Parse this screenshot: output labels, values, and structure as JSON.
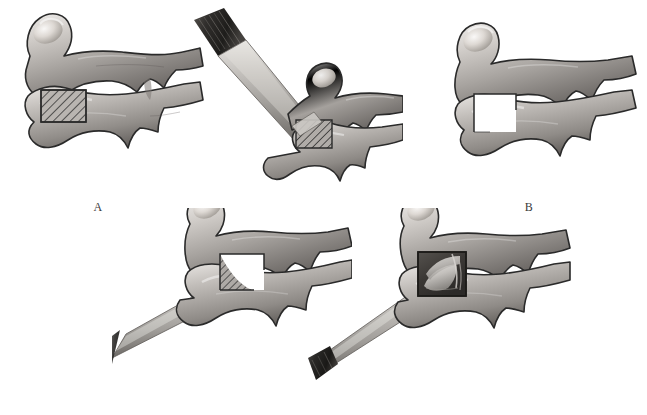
{
  "figure": {
    "background_color": "#ffffff",
    "panel_count": 5,
    "modality": "grayscale medical line-and-wash illustration",
    "view": "lateral view of two adjacent cervical vertebrae"
  },
  "palette": {
    "background": "#ffffff",
    "outline": "#2a2a2a",
    "bone_light": "#f2f0ee",
    "bone_midlight": "#cfcbc7",
    "bone_mid": "#a8a4a0",
    "bone_dark": "#6e6a67",
    "bone_shadow": "#4a4643",
    "hatch_line": "#2e2e2e",
    "hatch_fill": "#b9b5b1",
    "instrument_shaft_light": "#d8d6d3",
    "instrument_shaft_mid": "#a9a6a2",
    "instrument_shaft_dark": "#6f6c68",
    "instrument_handle_dark": "#2c2b29",
    "instrument_handle_mid": "#565451",
    "graft_dark": "#3a3835",
    "graft_light": "#d5d2ce",
    "label_text": "#3b3b3b"
  },
  "panels": [
    {
      "id": "panel-a",
      "label": "A",
      "caption_text": "A",
      "description": "Two adjacent cervical vertebrae in lateral view; a hatched rectangular zone marks the planned resection at the anterior superior endplate region of the lower vertebra.",
      "has_instrument": false,
      "has_hatched_region": true,
      "has_excised_notch": false,
      "has_graft_block": false,
      "vertebra_count": 2
    },
    {
      "id": "panel-b",
      "label": "B",
      "caption_text": "B",
      "description": "An osteotome/chisel enters from the upper left at an oblique downward angle, its cutting edge set against the hatched resection zone.",
      "has_instrument": true,
      "instrument_name": "osteotome",
      "instrument_approach": "upper-left oblique, descending to the right",
      "has_hatched_region": true,
      "has_excised_notch": false,
      "has_graft_block": false,
      "vertebra_count": 2
    },
    {
      "id": "panel-c",
      "label": "C",
      "caption_text": "C",
      "description": "The resection is complete; the removed wedge appears as an empty white stepped notch outlined in thin dark line between the two vertebral bodies.",
      "has_instrument": false,
      "has_hatched_region": false,
      "has_excised_notch": true,
      "has_graft_block": false,
      "vertebra_count": 2
    },
    {
      "id": "panel-d",
      "label": "D",
      "caption_text": "D",
      "description": "A second osteotome approaches from the lower left, angled upward to the right; a hatched zone marks the complementary resection on the opposing endplate.",
      "has_instrument": true,
      "instrument_name": "osteotome",
      "instrument_approach": "lower-left oblique, ascending to the right",
      "has_hatched_region": true,
      "has_excised_notch": true,
      "has_graft_block": false,
      "vertebra_count": 2
    },
    {
      "id": "panel-e",
      "label": "E",
      "caption_text": "E",
      "description": "A rectangular cancellous bone graft block is seated in the prepared interbody defect, delivered by the instrument entering from the lower left.",
      "has_instrument": true,
      "instrument_name": "graft impactor",
      "instrument_approach": "lower-left oblique, ascending to the right",
      "has_hatched_region": false,
      "has_excised_notch": false,
      "has_graft_block": true,
      "vertebra_count": 2
    }
  ],
  "labels": {
    "a": "A",
    "b": "B",
    "c": "C",
    "d": "D",
    "e": "E"
  }
}
